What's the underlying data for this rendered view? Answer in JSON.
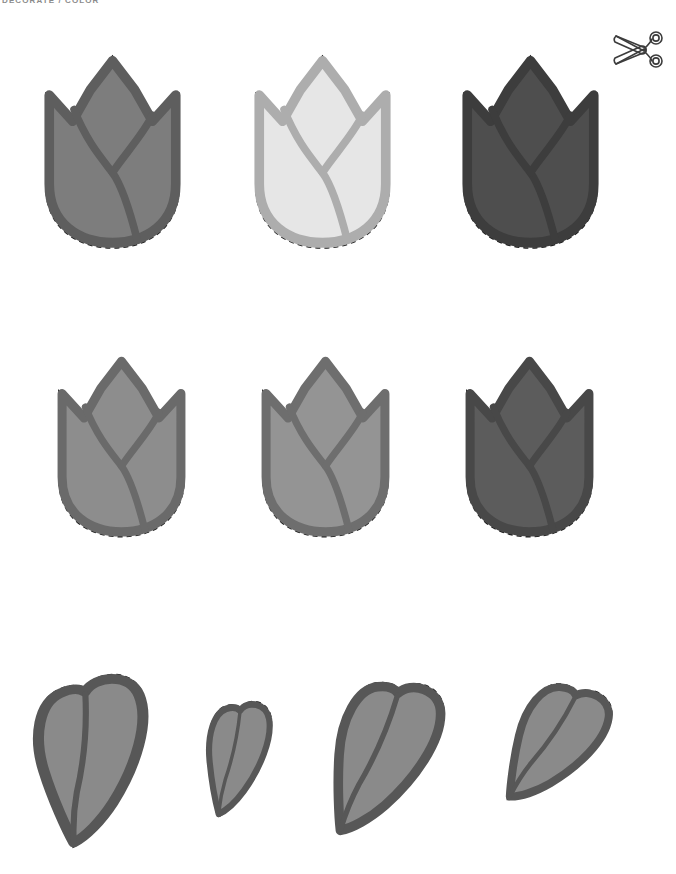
{
  "page": {
    "width": 676,
    "height": 874,
    "background": "#ffffff",
    "header_label": "DECORATE / COLOR",
    "document_type": "craft-cutout-template"
  },
  "icons": {
    "scissors": {
      "name": "scissors-icon",
      "stroke": "#3c3c3c",
      "label": "cut here"
    }
  },
  "palette": {
    "dashed_cut_line": "#1a1a1a",
    "medium_gray_fill": "#858585",
    "medium_gray_outline": "#666666",
    "light_gray_fill": "#e3e3e3",
    "light_gray_outline": "#b0b0b0",
    "dark_gray_fill": "#4f4f4f",
    "dark_gray_outline": "#3f3f3f",
    "leaf_fill": "#8a8a8a",
    "leaf_outline": "#595959",
    "row2_fill": "#8e8e8e",
    "row2_outline": "#6b6b6b",
    "row2_dark_fill": "#5a5a5a",
    "row2_dark_outline": "#4a4a4a"
  },
  "rows": [
    {
      "name": "tulip-row-1",
      "label": "Tulip blossoms — large",
      "shapes": [
        {
          "id": "tulip-1-1",
          "kind": "tulip",
          "x": 30,
          "y": 38,
          "w": 165,
          "h": 222,
          "fill": "#7d7d7d",
          "outline": "#5e5e5e",
          "tone": "medium"
        },
        {
          "id": "tulip-1-2",
          "kind": "tulip",
          "x": 240,
          "y": 38,
          "w": 165,
          "h": 222,
          "fill": "#e6e6e6",
          "outline": "#adadad",
          "tone": "light"
        },
        {
          "id": "tulip-1-3",
          "kind": "tulip",
          "x": 448,
          "y": 38,
          "w": 165,
          "h": 222,
          "fill": "#4e4e4e",
          "outline": "#3d3d3d",
          "tone": "dark"
        }
      ]
    },
    {
      "name": "tulip-row-2",
      "label": "Tulip blossoms — medium",
      "shapes": [
        {
          "id": "tulip-2-1",
          "kind": "tulip",
          "x": 44,
          "y": 340,
          "w": 155,
          "h": 208,
          "fill": "#8d8d8d",
          "outline": "#6a6a6a",
          "tone": "medium"
        },
        {
          "id": "tulip-2-2",
          "kind": "tulip",
          "x": 248,
          "y": 340,
          "w": 155,
          "h": 208,
          "fill": "#949494",
          "outline": "#6e6e6e",
          "tone": "medium"
        },
        {
          "id": "tulip-2-3",
          "kind": "tulip",
          "x": 452,
          "y": 340,
          "w": 155,
          "h": 208,
          "fill": "#5c5c5c",
          "outline": "#484848",
          "tone": "dark"
        }
      ]
    },
    {
      "name": "leaf-row-3",
      "label": "Leaves",
      "shapes": [
        {
          "id": "leaf-3-1",
          "kind": "leaf",
          "x": 18,
          "y": 668,
          "w": 148,
          "h": 182,
          "fill": "#8a8a8a",
          "outline": "#575757",
          "rotate": -8
        },
        {
          "id": "leaf-3-2",
          "kind": "leaf",
          "x": 196,
          "y": 694,
          "w": 82,
          "h": 128,
          "fill": "#8a8a8a",
          "outline": "#575757",
          "rotate": 2
        },
        {
          "id": "leaf-3-3",
          "kind": "leaf",
          "x": 318,
          "y": 668,
          "w": 128,
          "h": 180,
          "fill": "#8a8a8a",
          "outline": "#575757",
          "rotate": 12
        },
        {
          "id": "leaf-3-4",
          "kind": "leaf",
          "x": 500,
          "y": 672,
          "w": 108,
          "h": 146,
          "fill": "#8a8a8a",
          "outline": "#575757",
          "rotate": 22
        }
      ]
    }
  ]
}
